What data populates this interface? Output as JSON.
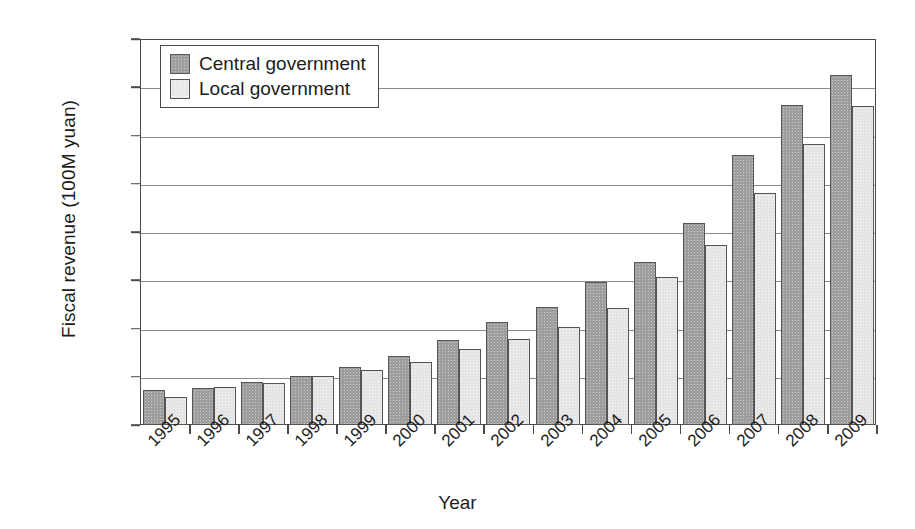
{
  "chart_data": {
    "type": "bar",
    "title": "",
    "xlabel": "Year",
    "ylabel": "Fiscal revenue (100M yuan)",
    "categories": [
      "1995",
      "1996",
      "1997",
      "1998",
      "1999",
      "2000",
      "2001",
      "2002",
      "2003",
      "2004",
      "2005",
      "2006",
      "2007",
      "2008",
      "2009"
    ],
    "series": [
      {
        "name": "Central government",
        "color": "#9d9d9d",
        "values": [
          3650,
          3800,
          4500,
          5100,
          6000,
          7200,
          8800,
          10700,
          12200,
          14800,
          16900,
          20900,
          28000,
          33200,
          36300
        ]
      },
      {
        "name": "Local government",
        "color": "#e4e4e4",
        "values": [
          2900,
          3900,
          4400,
          5100,
          5700,
          6500,
          7900,
          8900,
          10200,
          12100,
          15300,
          18700,
          24000,
          29100,
          33100
        ]
      }
    ],
    "ylim": [
      0,
      40000
    ],
    "ytick_values": [
      0,
      5000,
      10000,
      15000,
      20000,
      25000,
      30000,
      35000,
      40000
    ],
    "ytick_labels": [
      "0",
      "5000",
      "10,000",
      "15,000",
      "20,000",
      "25,000",
      "30,000",
      "35,000",
      "40,000"
    ],
    "grid": "horizontal",
    "legend_position": "top-left-inside"
  },
  "legend": {
    "items": [
      {
        "label": "Central government",
        "swatch": "central"
      },
      {
        "label": "Local government",
        "swatch": "local"
      }
    ]
  }
}
